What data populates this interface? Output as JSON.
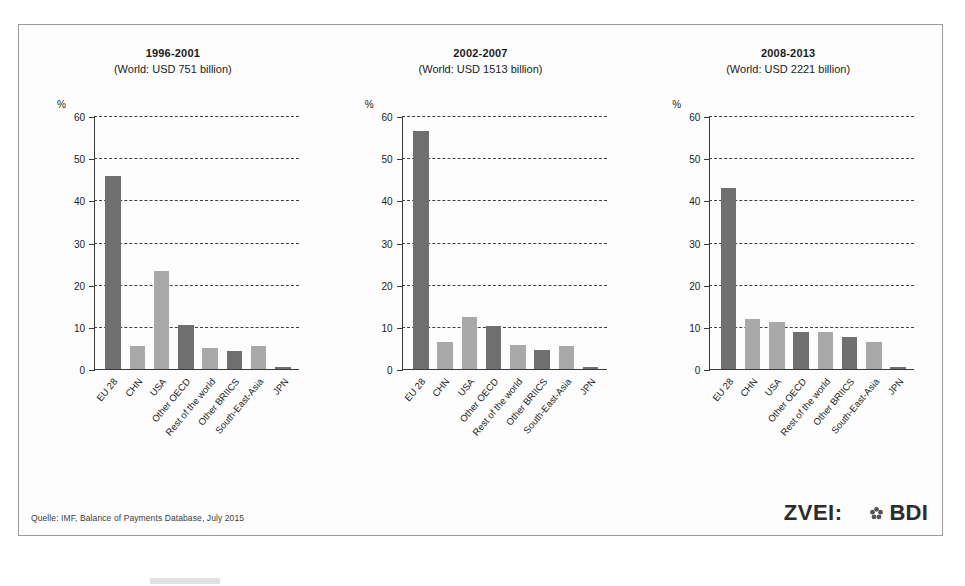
{
  "figure": {
    "source_note": "Quelle: IMF, Balance of Payments Database, July 2015",
    "y_axis_unit": "%",
    "logo_zvei": "ZVEI:",
    "logo_bdi": "BDI",
    "logo_bdi_icon": "flower-mark-icon"
  },
  "chart_data": [
    {
      "type": "bar",
      "title": "1996-2001",
      "subtitle": "(World: USD 751 billion)",
      "xlabel": "",
      "ylabel": "%",
      "ylim": [
        0,
        60
      ],
      "yticks": [
        0,
        10,
        20,
        30,
        40,
        50,
        60
      ],
      "grid": true,
      "legend": "none",
      "categories": [
        "EU 28",
        "CHN",
        "USA",
        "Other OECD",
        "Rest of the world",
        "Other BRIICS",
        "South-East-Asia",
        "JPN"
      ],
      "values": [
        46.0,
        5.5,
        23.4,
        10.5,
        5.0,
        4.3,
        5.5,
        0.4
      ],
      "bar_shades": [
        "dark",
        "light",
        "light",
        "dark",
        "light",
        "dark",
        "light",
        "dark"
      ]
    },
    {
      "type": "bar",
      "title": "2002-2007",
      "subtitle": "(World: USD 1513 billion)",
      "xlabel": "",
      "ylabel": "%",
      "ylim": [
        0,
        60
      ],
      "yticks": [
        0,
        10,
        20,
        30,
        40,
        50,
        60
      ],
      "grid": true,
      "legend": "none",
      "categories": [
        "EU 28",
        "CHN",
        "USA",
        "Other OECD",
        "Rest of the world",
        "Other BRIICS",
        "South-East-Asia",
        "JPN"
      ],
      "values": [
        56.6,
        6.5,
        12.3,
        10.2,
        5.8,
        4.5,
        5.4,
        0.4
      ],
      "bar_shades": [
        "dark",
        "light",
        "light",
        "dark",
        "light",
        "dark",
        "light",
        "dark"
      ]
    },
    {
      "type": "bar",
      "title": "2008-2013",
      "subtitle": "(World: USD 2221 billion)",
      "xlabel": "",
      "ylabel": "%",
      "ylim": [
        0,
        60
      ],
      "yticks": [
        0,
        10,
        20,
        30,
        40,
        50,
        60
      ],
      "grid": true,
      "legend": "none",
      "categories": [
        "EU 28",
        "CHN",
        "USA",
        "Other OECD",
        "Rest of the world",
        "Other BRIICS",
        "South-East-Asia",
        "JPN"
      ],
      "values": [
        43.0,
        12.0,
        11.3,
        8.8,
        8.7,
        7.7,
        6.4,
        0.4
      ],
      "bar_shades": [
        "dark",
        "light",
        "light",
        "dark",
        "light",
        "dark",
        "light",
        "dark"
      ]
    }
  ],
  "colors": {
    "bar_dark": "#6f6f6f",
    "bar_light": "#a9a9a9",
    "axis": "#3a3a3a",
    "frame": "#9a9a9a",
    "text": "#1a1a1a"
  }
}
